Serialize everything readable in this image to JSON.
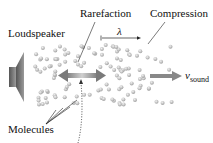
{
  "diagram": {
    "labels": {
      "loudspeaker": "Loudspeaker",
      "rarefaction": "Rarefaction",
      "compression": "Compression",
      "wavelength": "λ",
      "velocity_symbol": "v",
      "velocity_subscript": "sound",
      "molecules": "Molecules"
    },
    "colors": {
      "molecule": "#b8b8b8",
      "arrow": "#8a8a8a",
      "speaker": "#6e6e6e",
      "text": "#111111"
    },
    "regions": [
      {
        "name": "compression-1",
        "x_center": 58
      },
      {
        "name": "rarefaction",
        "x_center": 85
      },
      {
        "name": "compression-2",
        "x_center": 120
      }
    ]
  }
}
